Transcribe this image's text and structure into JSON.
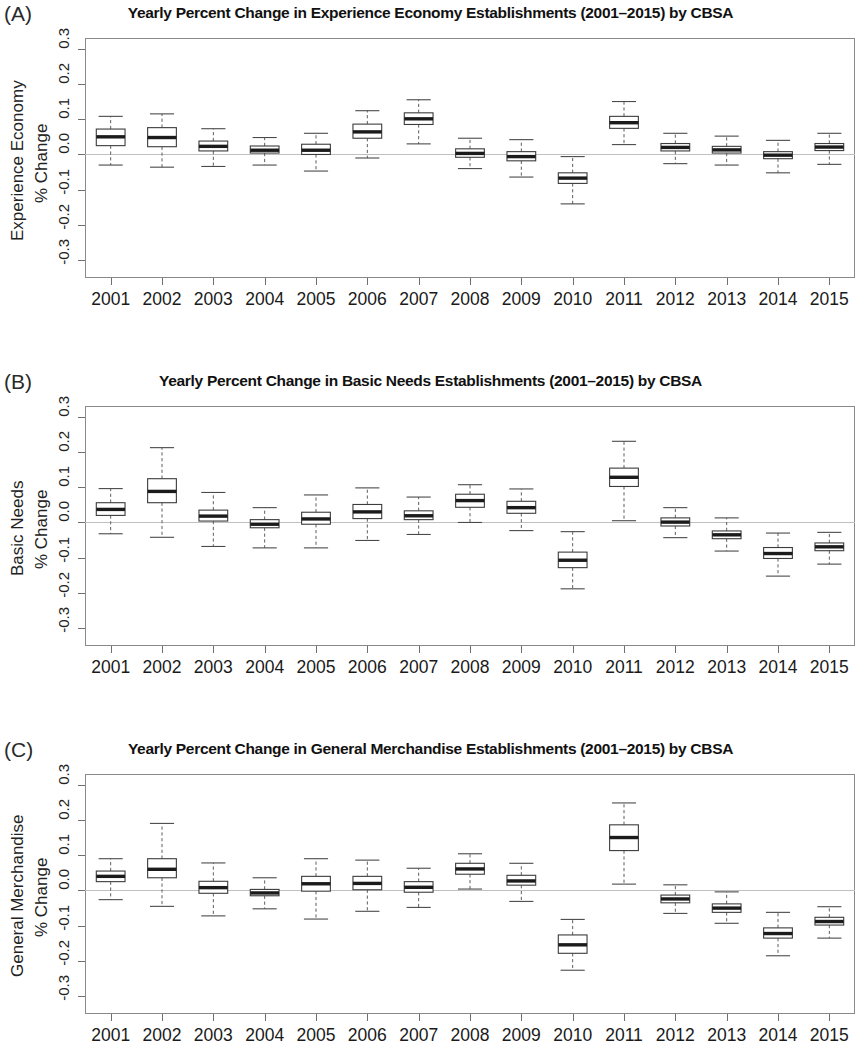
{
  "figure": {
    "width": 861,
    "height": 1059,
    "axis_label_line2": "% Change"
  },
  "panels": [
    {
      "label": "(A)",
      "title": "Yearly Percent Change in Experience Economy Establishments (2001–2015) by CBSA",
      "ylab_line1": "Experience Economy",
      "ylab_line2": "% Change"
    },
    {
      "label": "(B)",
      "title": "Yearly Percent Change in Basic Needs Establishments (2001–2015) by CBSA",
      "ylab_line1": "Basic Needs",
      "ylab_line2": "% Change"
    },
    {
      "label": "(C)",
      "title": "Yearly Percent Change in General Merchandise Establishments (2001–2015) by CBSA",
      "ylab_line1": "General Merchandise",
      "ylab_line2": "% Change"
    }
  ],
  "chart_data": [
    {
      "type": "box",
      "panel": "A",
      "title": "Yearly Percent Change in Experience Economy Establishments (2001–2015) by CBSA",
      "xlabel": "",
      "ylabel": "Experience Economy % Change",
      "ylim": [
        -0.35,
        0.33
      ],
      "yticks": [
        -0.3,
        -0.2,
        -0.1,
        0.0,
        0.1,
        0.2,
        0.3
      ],
      "ytick_labels": [
        "-0.3",
        "-0.2",
        "-0.1",
        "0.0",
        "0.1",
        "0.2",
        "0.3"
      ],
      "categories": [
        "2001",
        "2002",
        "2003",
        "2004",
        "2005",
        "2006",
        "2007",
        "2008",
        "2009",
        "2010",
        "2011",
        "2012",
        "2013",
        "2014",
        "2015"
      ],
      "grid": false,
      "zero_reference_line": 0.0,
      "boxes": [
        {
          "category": "2001",
          "whisker_low": -0.03,
          "q1": 0.025,
          "median": 0.05,
          "q3": 0.072,
          "whisker_high": 0.108
        },
        {
          "category": "2002",
          "whisker_low": -0.036,
          "q1": 0.022,
          "median": 0.048,
          "q3": 0.076,
          "whisker_high": 0.115
        },
        {
          "category": "2003",
          "whisker_low": -0.034,
          "q1": 0.01,
          "median": 0.023,
          "q3": 0.038,
          "whisker_high": 0.073
        },
        {
          "category": "2004",
          "whisker_low": -0.03,
          "q1": 0.004,
          "median": 0.012,
          "q3": 0.024,
          "whisker_high": 0.048
        },
        {
          "category": "2005",
          "whisker_low": -0.047,
          "q1": 0.0,
          "median": 0.012,
          "q3": 0.029,
          "whisker_high": 0.06
        },
        {
          "category": "2006",
          "whisker_low": -0.01,
          "q1": 0.046,
          "median": 0.064,
          "q3": 0.086,
          "whisker_high": 0.124
        },
        {
          "category": "2007",
          "whisker_low": 0.03,
          "q1": 0.085,
          "median": 0.101,
          "q3": 0.118,
          "whisker_high": 0.155
        },
        {
          "category": "2008",
          "whisker_low": -0.04,
          "q1": -0.008,
          "median": 0.003,
          "q3": 0.016,
          "whisker_high": 0.046
        },
        {
          "category": "2009",
          "whisker_low": -0.064,
          "q1": -0.018,
          "median": -0.006,
          "q3": 0.008,
          "whisker_high": 0.042
        },
        {
          "category": "2010",
          "whisker_low": -0.14,
          "q1": -0.082,
          "median": -0.067,
          "q3": -0.052,
          "whisker_high": -0.006
        },
        {
          "category": "2011",
          "whisker_low": 0.028,
          "q1": 0.074,
          "median": 0.09,
          "q3": 0.108,
          "whisker_high": 0.15
        },
        {
          "category": "2012",
          "whisker_low": -0.026,
          "q1": 0.01,
          "median": 0.02,
          "q3": 0.031,
          "whisker_high": 0.06
        },
        {
          "category": "2013",
          "whisker_low": -0.03,
          "q1": 0.004,
          "median": 0.013,
          "q3": 0.023,
          "whisker_high": 0.052
        },
        {
          "category": "2014",
          "whisker_low": -0.052,
          "q1": -0.012,
          "median": -0.002,
          "q3": 0.008,
          "whisker_high": 0.04
        },
        {
          "category": "2015",
          "whisker_low": -0.028,
          "q1": 0.011,
          "median": 0.021,
          "q3": 0.031,
          "whisker_high": 0.06
        }
      ]
    },
    {
      "type": "box",
      "panel": "B",
      "title": "Yearly Percent Change in Basic Needs Establishments (2001–2015) by CBSA",
      "xlabel": "",
      "ylabel": "Basic Needs % Change",
      "ylim": [
        -0.35,
        0.33
      ],
      "yticks": [
        -0.3,
        -0.2,
        -0.1,
        0.0,
        0.1,
        0.2,
        0.3
      ],
      "ytick_labels": [
        "-0.3",
        "-0.2",
        "-0.1",
        "0.0",
        "0.1",
        "0.2",
        "0.3"
      ],
      "categories": [
        "2001",
        "2002",
        "2003",
        "2004",
        "2005",
        "2006",
        "2007",
        "2008",
        "2009",
        "2010",
        "2011",
        "2012",
        "2013",
        "2014",
        "2015"
      ],
      "grid": false,
      "zero_reference_line": 0.0,
      "boxes": [
        {
          "category": "2001",
          "whisker_low": -0.032,
          "q1": 0.02,
          "median": 0.037,
          "q3": 0.056,
          "whisker_high": 0.096
        },
        {
          "category": "2002",
          "whisker_low": -0.042,
          "q1": 0.056,
          "median": 0.088,
          "q3": 0.124,
          "whisker_high": 0.212
        },
        {
          "category": "2003",
          "whisker_low": -0.068,
          "q1": 0.004,
          "median": 0.018,
          "q3": 0.035,
          "whisker_high": 0.085
        },
        {
          "category": "2004",
          "whisker_low": -0.072,
          "q1": -0.015,
          "median": -0.005,
          "q3": 0.008,
          "whisker_high": 0.042
        },
        {
          "category": "2005",
          "whisker_low": -0.072,
          "q1": -0.005,
          "median": 0.01,
          "q3": 0.029,
          "whisker_high": 0.078
        },
        {
          "category": "2006",
          "whisker_low": -0.051,
          "q1": 0.011,
          "median": 0.03,
          "q3": 0.051,
          "whisker_high": 0.098
        },
        {
          "category": "2007",
          "whisker_low": -0.034,
          "q1": 0.008,
          "median": 0.019,
          "q3": 0.033,
          "whisker_high": 0.072
        },
        {
          "category": "2008",
          "whisker_low": 0.0,
          "q1": 0.043,
          "median": 0.062,
          "q3": 0.08,
          "whisker_high": 0.107
        },
        {
          "category": "2009",
          "whisker_low": -0.023,
          "q1": 0.026,
          "median": 0.042,
          "q3": 0.06,
          "whisker_high": 0.095
        },
        {
          "category": "2010",
          "whisker_low": -0.188,
          "q1": -0.128,
          "median": -0.107,
          "q3": -0.084,
          "whisker_high": -0.026
        },
        {
          "category": "2011",
          "whisker_low": 0.005,
          "q1": 0.102,
          "median": 0.128,
          "q3": 0.154,
          "whisker_high": 0.23
        },
        {
          "category": "2012",
          "whisker_low": -0.043,
          "q1": -0.01,
          "median": 0.001,
          "q3": 0.013,
          "whisker_high": 0.042
        },
        {
          "category": "2013",
          "whisker_low": -0.081,
          "q1": -0.046,
          "median": -0.035,
          "q3": -0.024,
          "whisker_high": 0.013
        },
        {
          "category": "2014",
          "whisker_low": -0.152,
          "q1": -0.102,
          "median": -0.088,
          "q3": -0.071,
          "whisker_high": -0.03
        },
        {
          "category": "2015",
          "whisker_low": -0.118,
          "q1": -0.08,
          "median": -0.069,
          "q3": -0.058,
          "whisker_high": -0.028
        }
      ]
    },
    {
      "type": "box",
      "panel": "C",
      "title": "Yearly Percent Change in General Merchandise Establishments (2001–2015) by CBSA",
      "xlabel": "",
      "ylabel": "General Merchandise % Change",
      "ylim": [
        -0.35,
        0.33
      ],
      "yticks": [
        -0.3,
        -0.2,
        -0.1,
        0.0,
        0.1,
        0.2,
        0.3
      ],
      "ytick_labels": [
        "-0.3",
        "-0.2",
        "-0.1",
        "0.0",
        "0.1",
        "0.2",
        "0.3"
      ],
      "categories": [
        "2001",
        "2002",
        "2003",
        "2004",
        "2005",
        "2006",
        "2007",
        "2008",
        "2009",
        "2010",
        "2011",
        "2012",
        "2013",
        "2014",
        "2015"
      ],
      "grid": false,
      "zero_reference_line": 0.0,
      "boxes": [
        {
          "category": "2001",
          "whisker_low": -0.026,
          "q1": 0.025,
          "median": 0.04,
          "q3": 0.055,
          "whisker_high": 0.09
        },
        {
          "category": "2002",
          "whisker_low": -0.045,
          "q1": 0.036,
          "median": 0.06,
          "q3": 0.09,
          "whisker_high": 0.19
        },
        {
          "category": "2003",
          "whisker_low": -0.072,
          "q1": -0.008,
          "median": 0.008,
          "q3": 0.026,
          "whisker_high": 0.078
        },
        {
          "category": "2004",
          "whisker_low": -0.052,
          "q1": -0.015,
          "median": -0.007,
          "q3": 0.003,
          "whisker_high": 0.036
        },
        {
          "category": "2005",
          "whisker_low": -0.081,
          "q1": -0.002,
          "median": 0.019,
          "q3": 0.04,
          "whisker_high": 0.09
        },
        {
          "category": "2006",
          "whisker_low": -0.059,
          "q1": 0.002,
          "median": 0.02,
          "q3": 0.04,
          "whisker_high": 0.086
        },
        {
          "category": "2007",
          "whisker_low": -0.048,
          "q1": -0.005,
          "median": 0.009,
          "q3": 0.025,
          "whisker_high": 0.063
        },
        {
          "category": "2008",
          "whisker_low": 0.004,
          "q1": 0.046,
          "median": 0.061,
          "q3": 0.077,
          "whisker_high": 0.104
        },
        {
          "category": "2009",
          "whisker_low": -0.031,
          "q1": 0.015,
          "median": 0.027,
          "q3": 0.043,
          "whisker_high": 0.077
        },
        {
          "category": "2010",
          "whisker_low": -0.226,
          "q1": -0.178,
          "median": -0.154,
          "q3": -0.126,
          "whisker_high": -0.082
        },
        {
          "category": "2011",
          "whisker_low": 0.018,
          "q1": 0.113,
          "median": 0.15,
          "q3": 0.186,
          "whisker_high": 0.248
        },
        {
          "category": "2012",
          "whisker_low": -0.065,
          "q1": -0.035,
          "median": -0.024,
          "q3": -0.013,
          "whisker_high": 0.016
        },
        {
          "category": "2013",
          "whisker_low": -0.093,
          "q1": -0.062,
          "median": -0.05,
          "q3": -0.038,
          "whisker_high": -0.004
        },
        {
          "category": "2014",
          "whisker_low": -0.185,
          "q1": -0.135,
          "median": -0.122,
          "q3": -0.106,
          "whisker_high": -0.062
        },
        {
          "category": "2015",
          "whisker_low": -0.135,
          "q1": -0.098,
          "median": -0.088,
          "q3": -0.076,
          "whisker_high": -0.046
        }
      ]
    }
  ]
}
